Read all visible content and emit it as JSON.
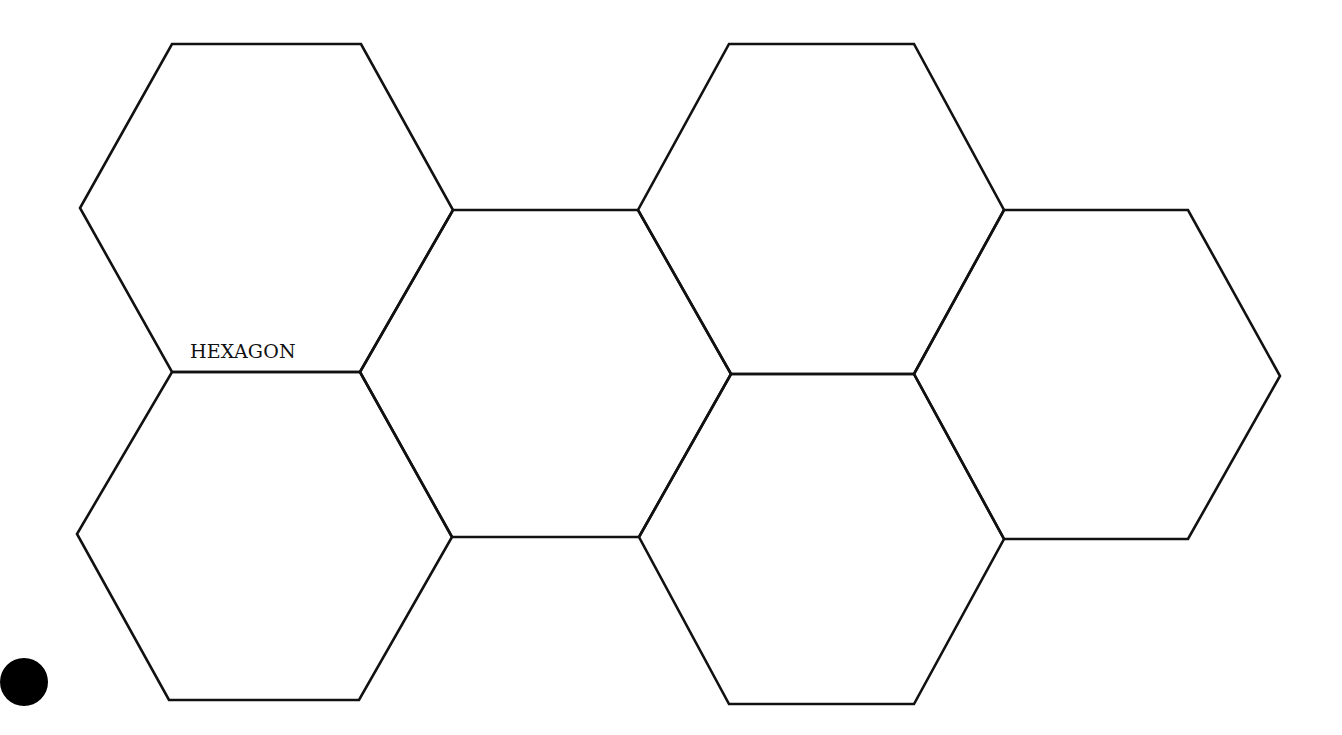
{
  "diagram": {
    "type": "hexagon-tessellation",
    "stroke_color": "#111111",
    "background": "#ffffff",
    "label": {
      "text": "HEXAGON",
      "x": 190,
      "y": 340
    },
    "marker": {
      "shape": "filled-circle",
      "color": "#000000",
      "cx": 24,
      "cy": 682,
      "r": 24
    },
    "hexagons": [
      {
        "id": "hex-top-left",
        "points": "172,44 361,44 453,210 360,372 172,372 80,208"
      },
      {
        "id": "hex-bottom-left",
        "points": "172,372 360,372 452,537 359,700 169,700 77,534"
      },
      {
        "id": "hex-middle-left",
        "points": "453,210 638,210 731,374 639,537 452,537 360,372"
      },
      {
        "id": "hex-top-right",
        "points": "729,44 914,44 1004,210 914,374 731,374 638,210"
      },
      {
        "id": "hex-bottom-middle",
        "points": "731,374 914,374 1004,539 914,704 729,704 639,537"
      },
      {
        "id": "hex-right",
        "points": "1004,210 1188,210 1280,376 1188,539 1004,539 914,374"
      }
    ]
  }
}
